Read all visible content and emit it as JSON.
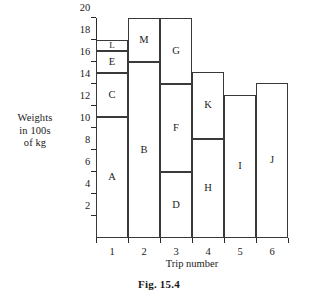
{
  "chart_data": {
    "type": "bar",
    "title": "",
    "subtitle": "",
    "xlabel": "Trip number",
    "ylabel": "Weights in 100s of kg",
    "ylabel_lines": [
      "Weights",
      "in 100s",
      "of kg"
    ],
    "categories": [
      "1",
      "2",
      "3",
      "4",
      "5",
      "6"
    ],
    "ylim": [
      0,
      20
    ],
    "xlim": [
      0,
      6
    ],
    "yticks": [
      2,
      4,
      6,
      8,
      10,
      12,
      14,
      16,
      18,
      20
    ],
    "ytick_labels": [
      "2",
      "4",
      "6",
      "8",
      "10",
      "12",
      "14",
      "16",
      "18",
      "20"
    ],
    "grid": false,
    "legend": "none",
    "stacked": true,
    "bar_totals": [
      18,
      20,
      20,
      15.1,
      13,
      14.1
    ],
    "bars": [
      {
        "category": "1",
        "total": 18,
        "segments": [
          {
            "label": "A",
            "bottom": 0,
            "top": 11,
            "value": 11
          },
          {
            "label": "C",
            "bottom": 11,
            "top": 15,
            "value": 4
          },
          {
            "label": "E",
            "bottom": 15,
            "top": 17,
            "value": 2
          },
          {
            "label": "L",
            "bottom": 17,
            "top": 18,
            "value": 1
          }
        ]
      },
      {
        "category": "2",
        "total": 20,
        "segments": [
          {
            "label": "B",
            "bottom": 0,
            "top": 16,
            "value": 16
          },
          {
            "label": "M",
            "bottom": 16,
            "top": 20,
            "value": 4
          }
        ]
      },
      {
        "category": "3",
        "total": 20,
        "segments": [
          {
            "label": "D",
            "bottom": 0,
            "top": 6,
            "value": 6
          },
          {
            "label": "F",
            "bottom": 6,
            "top": 14,
            "value": 8
          },
          {
            "label": "G",
            "bottom": 14,
            "top": 20,
            "value": 6
          }
        ]
      },
      {
        "category": "4",
        "total": 15.1,
        "segments": [
          {
            "label": "H",
            "bottom": 0,
            "top": 9,
            "value": 9
          },
          {
            "label": "K",
            "bottom": 9,
            "top": 15.1,
            "value": 6.1
          }
        ]
      },
      {
        "category": "5",
        "total": 13,
        "segments": [
          {
            "label": "I",
            "bottom": 0,
            "top": 13,
            "value": 13
          }
        ]
      },
      {
        "category": "6",
        "total": 14.1,
        "segments": [
          {
            "label": "J",
            "bottom": 0,
            "top": 14.1,
            "value": 14.1
          }
        ]
      }
    ],
    "colors": {
      "segment_fill": "#ffffff",
      "segment_stroke": "#3a3a3a",
      "axis": "#2b2b2b",
      "text": "#1a1a1a",
      "background": "#ffffff"
    }
  },
  "caption": "Fig. 15.4"
}
